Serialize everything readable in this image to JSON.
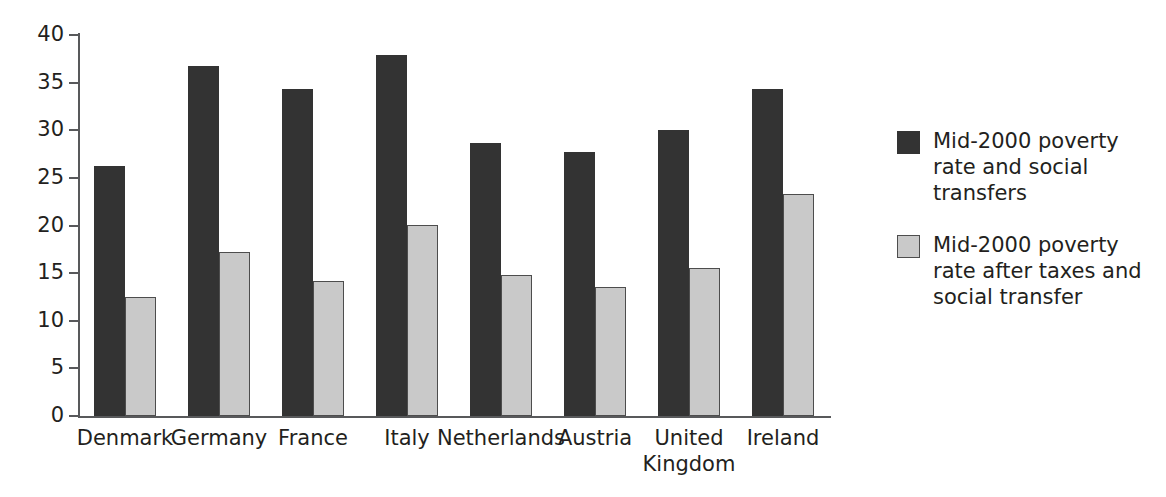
{
  "chart_data": {
    "type": "bar",
    "title": "",
    "subtitle": "",
    "xlabel": "",
    "ylabel": "",
    "ylim": [
      0,
      40
    ],
    "yticks": [
      0,
      5,
      10,
      15,
      20,
      25,
      30,
      35,
      40
    ],
    "ytick_labels": [
      "0",
      "5",
      "10",
      "15",
      "20",
      "25",
      "30",
      "35",
      "40"
    ],
    "grid": false,
    "legend_position": "right",
    "categories": [
      "Denmark",
      "Germany",
      "France",
      "Italy",
      "Netherlands",
      "Austria",
      "United\nKingdom",
      "Ireland"
    ],
    "series": [
      {
        "name": "Mid-2000 poverty rate and social transfers",
        "color": "#333333",
        "values": [
          26.2,
          36.7,
          34.3,
          37.9,
          28.7,
          27.7,
          30.0,
          34.3
        ]
      },
      {
        "name": "Mid-2000 poverty rate after taxes and social transfer",
        "color": "#c9c9c9",
        "values": [
          12.5,
          17.2,
          14.2,
          20.1,
          14.8,
          13.5,
          15.5,
          23.3
        ]
      }
    ],
    "annotations": []
  },
  "legend": {
    "entries": [
      {
        "swatch": "dark",
        "label": "Mid-2000 poverty rate and social transfers"
      },
      {
        "swatch": "light",
        "label": "Mid-2000 poverty rate after taxes and social transfer"
      }
    ]
  },
  "colors": {
    "series_dark": "#333333",
    "series_light": "#c9c9c9",
    "axis": "#58595b",
    "text": "#231f20",
    "background": "#ffffff"
  }
}
